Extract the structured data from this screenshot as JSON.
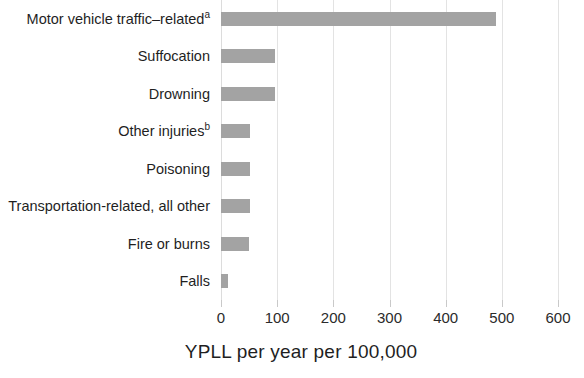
{
  "chart_data": {
    "type": "bar",
    "orientation": "horizontal",
    "title": "",
    "subtitle": "",
    "xlabel": "YPLL per year per 100,000",
    "ylabel": "",
    "xlim": [
      0,
      600
    ],
    "xticks": [
      0,
      100,
      200,
      300,
      400,
      500,
      600
    ],
    "xtick_labels": [
      "0",
      "100",
      "200",
      "300",
      "400",
      "500",
      "600"
    ],
    "grid": true,
    "grid_axis": "x",
    "legend": false,
    "legend_position": "none",
    "bar_color": "#a3a3a3",
    "background_color": "#ffffff",
    "text_color": "#1f1f1f",
    "gridline_color": "#e3e3e3",
    "categories": [
      "Motor vehicle traffic–related",
      "Suffocation",
      "Drowning",
      "Other injuries",
      "Poisoning",
      "Transportation-related, all other",
      "Fire or burns",
      "Falls"
    ],
    "category_footnotes": [
      "a",
      "",
      "",
      "b",
      "",
      "",
      "",
      ""
    ],
    "values": [
      490,
      96,
      96,
      52,
      52,
      51,
      50,
      13
    ]
  },
  "axis": {
    "title": "YPLL per year per 100,000"
  }
}
